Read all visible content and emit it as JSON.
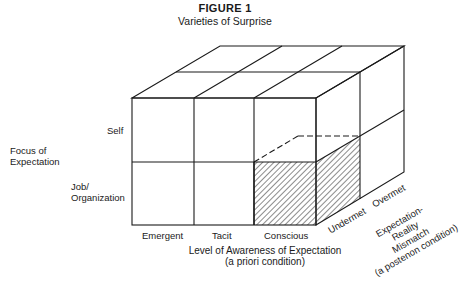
{
  "figure": {
    "title": "FIGURE 1",
    "subtitle": "Varieties of Surprise"
  },
  "y_axis": {
    "title_line1": "Focus of",
    "title_line2": "Expectation",
    "rows": [
      {
        "line1": "Self",
        "line2": ""
      },
      {
        "line1": "Job/",
        "line2": "Organization"
      }
    ]
  },
  "x_axis": {
    "columns": [
      "Emergent",
      "Tacit",
      "Conscious"
    ],
    "title_line1": "Level of Awareness of Expectation",
    "title_line2": "(a priori condition)"
  },
  "z_axis": {
    "depth_labels": [
      "Undermet",
      "Overmet"
    ],
    "title_lines": [
      "Expectation-",
      "Reality",
      "Mismatch",
      "(a postenon condition)"
    ]
  },
  "highlight": {
    "cell": "Job/Organization × Conscious × Undermet",
    "pattern": "diagonal-hatch",
    "color": "#1a1a1a"
  },
  "colors": {
    "line": "#1a1a1a",
    "background": "#ffffff"
  }
}
